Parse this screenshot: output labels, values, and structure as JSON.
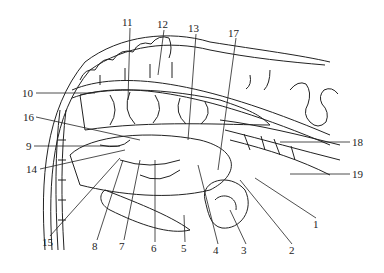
{
  "figure": {
    "ink_color": "#222222",
    "background": "#ffffff"
  },
  "labels": [
    {
      "id": "1",
      "text": "1",
      "x": 313,
      "y": 219
    },
    {
      "id": "2",
      "text": "2",
      "x": 289,
      "y": 245
    },
    {
      "id": "3",
      "text": "3",
      "x": 241,
      "y": 245
    },
    {
      "id": "4",
      "text": "4",
      "x": 213,
      "y": 245
    },
    {
      "id": "5",
      "text": "5",
      "x": 181,
      "y": 243
    },
    {
      "id": "6",
      "text": "6",
      "x": 151,
      "y": 243
    },
    {
      "id": "7",
      "text": "7",
      "x": 119,
      "y": 241
    },
    {
      "id": "8",
      "text": "8",
      "x": 92,
      "y": 241
    },
    {
      "id": "9",
      "text": "9",
      "x": 26,
      "y": 141
    },
    {
      "id": "10",
      "text": "10",
      "x": 22,
      "y": 88
    },
    {
      "id": "11",
      "text": "11",
      "x": 122,
      "y": 17
    },
    {
      "id": "12",
      "text": "12",
      "x": 157,
      "y": 19
    },
    {
      "id": "13",
      "text": "13",
      "x": 188,
      "y": 23
    },
    {
      "id": "14",
      "text": "14",
      "x": 26,
      "y": 164
    },
    {
      "id": "15",
      "text": "15",
      "x": 42,
      "y": 237
    },
    {
      "id": "16",
      "text": "16",
      "x": 23,
      "y": 112
    },
    {
      "id": "17",
      "text": "17",
      "x": 228,
      "y": 28
    },
    {
      "id": "18",
      "text": "18",
      "x": 352,
      "y": 137
    },
    {
      "id": "19",
      "text": "19",
      "x": 352,
      "y": 169
    }
  ]
}
